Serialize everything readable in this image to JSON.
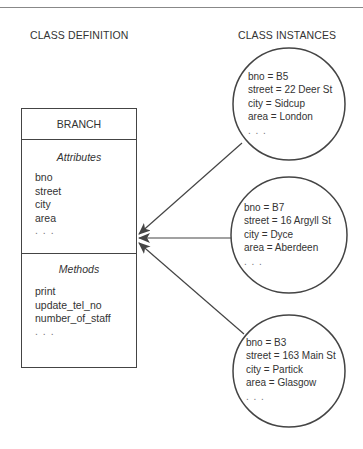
{
  "headings": {
    "definition": "CLASS DEFINITION",
    "instances": "CLASS INSTANCES"
  },
  "class": {
    "name": "BRANCH",
    "attributes_title": "Attributes",
    "attributes": [
      "bno",
      "street",
      "city",
      "area",
      ". . ."
    ],
    "methods_title": "Methods",
    "methods": [
      "print",
      "update_tel_no",
      "number_of_staff",
      ". . ."
    ]
  },
  "instances": [
    {
      "lines": [
        "bno = B5",
        "street = 22 Deer St",
        "city = Sidcup",
        "area = London",
        ". . ."
      ]
    },
    {
      "lines": [
        "bno = B7",
        "street = 16 Argyll St",
        "city = Dyce",
        "area = Aberdeen",
        ". . ."
      ]
    },
    {
      "lines": [
        "bno = B3",
        "street = 163 Main St",
        "city = Partick",
        "area = Glasgow",
        ". . ."
      ]
    }
  ],
  "colors": {
    "stroke": "#444444",
    "text": "#333333",
    "rule": "#888888"
  }
}
